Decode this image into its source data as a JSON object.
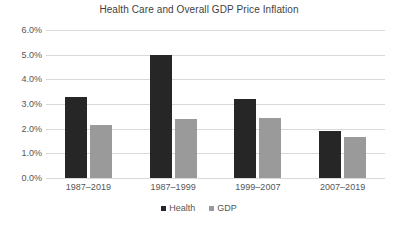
{
  "chart_data": {
    "type": "bar",
    "title": "Health Care and Overall GDP Price Inflation",
    "xlabel": "",
    "ylabel": "",
    "categories": [
      "1987–2019",
      "1987–1999",
      "1999–2007",
      "2007–2019"
    ],
    "series": [
      {
        "name": "Health",
        "color": "#262626",
        "values": [
          3.3,
          5.0,
          3.2,
          1.9
        ]
      },
      {
        "name": "GDP",
        "color": "#9a9a9a",
        "values": [
          2.15,
          2.4,
          2.45,
          1.65
        ]
      }
    ],
    "ylim": [
      0,
      6
    ],
    "ytick_values": [
      6.0,
      5.0,
      4.0,
      3.0,
      2.0,
      1.0,
      0.0
    ],
    "ytick_labels": [
      "6.0%",
      "5.0%",
      "4.0%",
      "3.0%",
      "2.0%",
      "1.0%",
      "0.0%"
    ],
    "grid": "horizontal",
    "legend_position": "bottom",
    "legend_entries": [
      "Health",
      "GDP"
    ]
  }
}
